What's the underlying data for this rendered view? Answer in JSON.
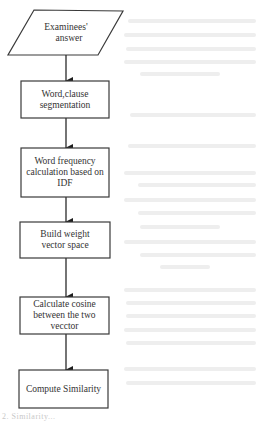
{
  "flowchart": {
    "input_node": {
      "shape": "parallelogram",
      "label_lines": [
        "Examinees'",
        "answer"
      ]
    },
    "steps": [
      {
        "label": "Word,clause segmentation"
      },
      {
        "label": "Word frequency calculation based on IDF"
      },
      {
        "label": "Build  weight vector space"
      },
      {
        "label": "Calculate cosine between the two vecctor"
      },
      {
        "label": "Compute Similarity"
      }
    ],
    "connector_count": 5,
    "colors": {
      "stroke": "#3a3a3a",
      "text": "#333333",
      "background": "#ffffff",
      "bleed_through": "#eeeeee"
    }
  },
  "caption": {
    "text": "2. Similarity..."
  }
}
